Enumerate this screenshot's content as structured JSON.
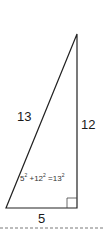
{
  "diagram": {
    "type": "right-triangle",
    "hypotenuse_label": "13",
    "vertical_leg_label": "12",
    "base_label": "5",
    "equation": {
      "a": "5",
      "b": "12",
      "c": "13",
      "exp": "2",
      "plus": "+",
      "equals": "="
    },
    "colors": {
      "stroke": "#222222",
      "dashed": "#555555"
    }
  }
}
